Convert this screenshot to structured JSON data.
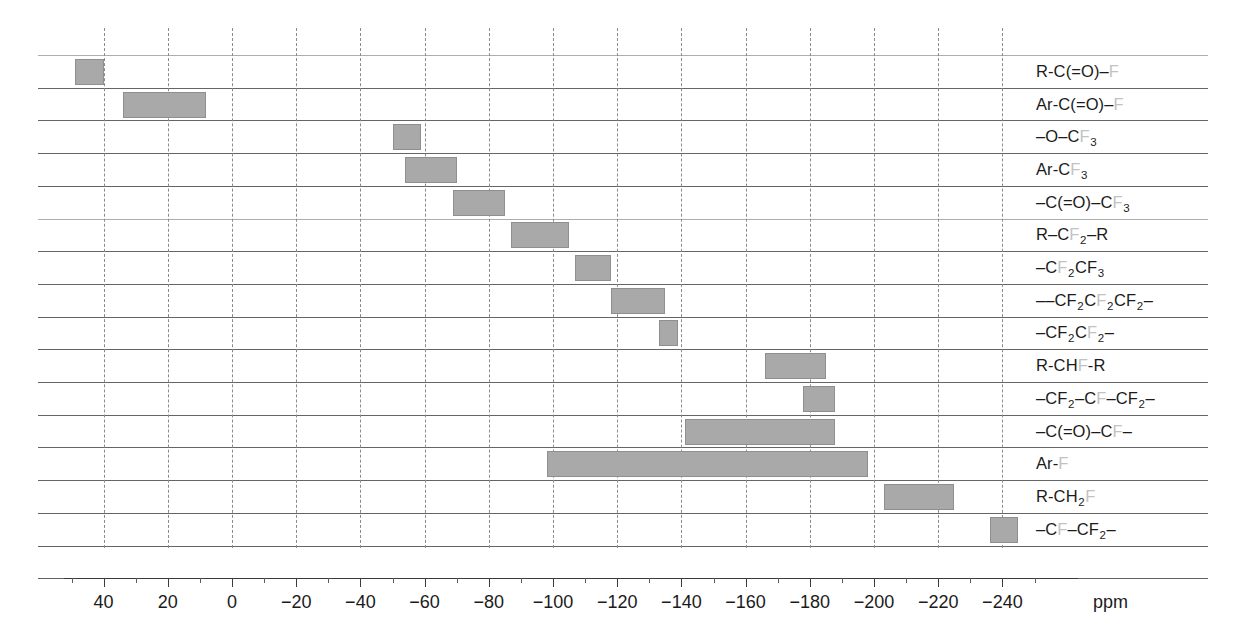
{
  "chart_data": {
    "type": "bar",
    "orientation": "horizontal",
    "title": "",
    "xlabel": "ppm",
    "ylabel": "",
    "xlim": [
      55,
      -250
    ],
    "x_axis_reversed": true,
    "grid": "horizontal-solid-and-vertical-dashed",
    "legend": "none",
    "unit": "ppm",
    "tick_labels": [
      "40",
      "20",
      "0",
      "-20",
      "-40",
      "-60",
      "-80",
      "-100",
      "-120",
      "-140",
      "-160",
      "-180",
      "-200",
      "-220",
      "-240"
    ],
    "tick_values": [
      40,
      20,
      0,
      -20,
      -40,
      -60,
      -80,
      -100,
      -120,
      -140,
      -160,
      -180,
      -200,
      -220,
      -240
    ],
    "minor_tick_step": 10,
    "categories": [
      "R-C(=O)-F",
      "Ar-C(=O)-F",
      "-O-CF3",
      "Ar-CF3",
      "-C(=O)-CF3",
      "R-CF2-R",
      "-CF2CF3",
      "-CF2CF2CF2-",
      "-CF2CF2-",
      "R-CHF-R",
      "-CF2-CF-CF2-",
      "-C(=O)-CF-",
      "Ar-F",
      "R-CH2F",
      "-CF-CF2-"
    ],
    "ranges": [
      [
        49,
        40
      ],
      [
        34,
        8
      ],
      [
        -50,
        -59
      ],
      [
        -54,
        -70
      ],
      [
        -69,
        -85
      ],
      [
        -87,
        -105
      ],
      [
        -107,
        -118
      ],
      [
        -118,
        -135
      ],
      [
        -133,
        -139
      ],
      [
        -166,
        -185
      ],
      [
        -178,
        -188
      ],
      [
        -141,
        -188
      ],
      [
        -98,
        -198
      ],
      [
        -203,
        -225
      ],
      [
        -236,
        -245
      ]
    ],
    "bar_color": "#a9a9a9"
  },
  "rows": [
    {
      "id": "acyl-fluoride",
      "parts": [
        {
          "t": "R-C(=O)–",
          "f": false
        },
        {
          "t": "F",
          "f": true
        }
      ],
      "from": 49,
      "to": 40
    },
    {
      "id": "aroyl-fluoride",
      "parts": [
        {
          "t": "Ar-C(=O)–",
          "f": false
        },
        {
          "t": "F",
          "f": true
        }
      ],
      "from": 34,
      "to": 8
    },
    {
      "id": "trifluoromethoxy",
      "parts": [
        {
          "t": "–O–C",
          "f": false
        },
        {
          "t": "F",
          "f": true
        },
        {
          "t": "3",
          "f": false,
          "sub": true
        }
      ],
      "from": -50,
      "to": -59
    },
    {
      "id": "aryl-trifluoromethyl",
      "parts": [
        {
          "t": "Ar-C",
          "f": false
        },
        {
          "t": "F",
          "f": true
        },
        {
          "t": "3",
          "f": false,
          "sub": true
        }
      ],
      "from": -54,
      "to": -70
    },
    {
      "id": "carbonyl-trifluoromethyl",
      "parts": [
        {
          "t": "–C(=O)–C",
          "f": false
        },
        {
          "t": "F",
          "f": true
        },
        {
          "t": "3",
          "f": false,
          "sub": true
        }
      ],
      "from": -69,
      "to": -85
    },
    {
      "id": "alkyl-difluoromethylene",
      "parts": [
        {
          "t": "R–C",
          "f": false
        },
        {
          "t": "F",
          "f": true
        },
        {
          "t": "2",
          "f": false,
          "sub": true
        },
        {
          "t": "–R",
          "f": false
        }
      ],
      "from": -87,
      "to": -105
    },
    {
      "id": "cf2-cf3",
      "parts": [
        {
          "t": "–C",
          "f": false
        },
        {
          "t": "F",
          "f": true
        },
        {
          "t": "2",
          "f": false,
          "sub": true
        },
        {
          "t": "CF",
          "f": false
        },
        {
          "t": "3",
          "f": false,
          "sub": true
        }
      ],
      "from": -107,
      "to": -118
    },
    {
      "id": "cf2-cf2-cf2",
      "parts": [
        {
          "t": "––CF",
          "f": false
        },
        {
          "t": "2",
          "f": false,
          "sub": true
        },
        {
          "t": "C",
          "f": false
        },
        {
          "t": "F",
          "f": true
        },
        {
          "t": "2",
          "f": false,
          "sub": true
        },
        {
          "t": "CF",
          "f": false
        },
        {
          "t": "2",
          "f": false,
          "sub": true
        },
        {
          "t": "–",
          "f": false
        }
      ],
      "from": -118,
      "to": -135
    },
    {
      "id": "cf2-cf2",
      "parts": [
        {
          "t": "–CF",
          "f": false
        },
        {
          "t": "2",
          "f": false,
          "sub": true
        },
        {
          "t": "C",
          "f": false
        },
        {
          "t": "F",
          "f": true
        },
        {
          "t": "2",
          "f": false,
          "sub": true
        },
        {
          "t": "–",
          "f": false
        }
      ],
      "from": -133,
      "to": -139
    },
    {
      "id": "secondary-chf",
      "parts": [
        {
          "t": "R-CH",
          "f": false
        },
        {
          "t": "F",
          "f": true
        },
        {
          "t": "-R",
          "f": false
        }
      ],
      "from": -166,
      "to": -185
    },
    {
      "id": "tertiary-cf",
      "parts": [
        {
          "t": "–CF",
          "f": false
        },
        {
          "t": "2",
          "f": false,
          "sub": true
        },
        {
          "t": "–C",
          "f": false
        },
        {
          "t": "F",
          "f": true
        },
        {
          "t": "–CF",
          "f": false
        },
        {
          "t": "2",
          "f": false,
          "sub": true
        },
        {
          "t": "–",
          "f": false
        }
      ],
      "from": -178,
      "to": -188
    },
    {
      "id": "carbonyl-cf",
      "parts": [
        {
          "t": "–C(=O)–C",
          "f": false
        },
        {
          "t": "F",
          "f": true
        },
        {
          "t": "–",
          "f": false
        }
      ],
      "from": -141,
      "to": -188
    },
    {
      "id": "aryl-fluoride",
      "parts": [
        {
          "t": "Ar-",
          "f": false
        },
        {
          "t": "F",
          "f": true
        }
      ],
      "from": -98,
      "to": -198
    },
    {
      "id": "primary-ch2f",
      "parts": [
        {
          "t": "R-CH",
          "f": false
        },
        {
          "t": "2",
          "f": false,
          "sub": true
        },
        {
          "t": "F",
          "f": true
        }
      ],
      "from": -203,
      "to": -225
    },
    {
      "id": "cf-cf2",
      "parts": [
        {
          "t": "–C",
          "f": false
        },
        {
          "t": "F",
          "f": true
        },
        {
          "t": "–CF",
          "f": false
        },
        {
          "t": "2",
          "f": false,
          "sub": true
        },
        {
          "t": "–",
          "f": false
        }
      ],
      "from": -236,
      "to": -245
    }
  ],
  "axis": {
    "unit_label": "ppm",
    "ticks": [
      40,
      20,
      0,
      -20,
      -40,
      -60,
      -80,
      -100,
      -120,
      -140,
      -160,
      -180,
      -200,
      -220,
      -240
    ],
    "tick_text": [
      "40",
      "20",
      "0",
      "−20",
      "−40",
      "−60",
      "−80",
      "−100",
      "−120",
      "−140",
      "−160",
      "−180",
      "−200",
      "−220",
      "−240"
    ]
  },
  "colors": {
    "bar_fill": "#a9a9a9",
    "bar_stroke": "#8f8f8f",
    "grid_solid": "#4a4a4a",
    "grid_dashed": "#8b8b8b",
    "fluorine_text": "#c2c2c2",
    "text": "#1b1b1b"
  }
}
